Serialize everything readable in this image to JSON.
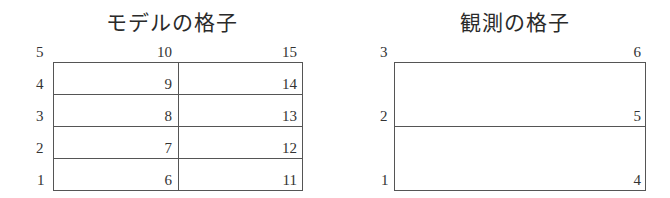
{
  "model_grid": {
    "title": "モデルの格子",
    "row_labels": [
      "5",
      "4",
      "3",
      "2",
      "1"
    ],
    "col1_labels": [
      "10",
      "9",
      "8",
      "7",
      "6"
    ],
    "col2_labels": [
      "15",
      "14",
      "13",
      "12",
      "11"
    ],
    "rows": 4,
    "cols": 2
  },
  "obs_grid": {
    "title": "観測の格子",
    "left_labels": [
      "3",
      "2",
      "1"
    ],
    "right_labels": [
      "6",
      "5",
      "4"
    ],
    "rows": 2,
    "cols": 1
  }
}
